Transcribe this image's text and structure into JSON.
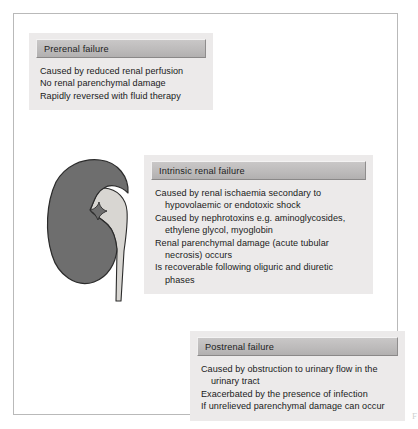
{
  "figure": {
    "edge_glyph": "F",
    "colors": {
      "panel_background": "#eceaea",
      "header_bar": "#bdbbbb",
      "text": "#1a1a1a",
      "frame_border": "#b9b9b9",
      "kidney_cortex": "#6e6e6e",
      "kidney_pelvis": "#d8d6d2",
      "kidney_outline": "#2b2b2b"
    }
  },
  "panels": [
    {
      "id": "prerenal",
      "title": "Prerenal failure",
      "lines": [
        "Caused by reduced renal perfusion",
        "No renal parenchymal damage",
        "Rapidly reversed with fluid therapy"
      ]
    },
    {
      "id": "intrinsic",
      "title": "Intrinsic renal failure",
      "lines": [
        "Caused by renal ischaemia secondary to hypovolaemic or endotoxic shock",
        "Caused by nephrotoxins e.g. aminoglycosides, ethylene glycol, myoglobin",
        "Renal parenchymal damage (acute tubular necrosis) occurs",
        "Is recoverable following oliguric and diuretic phases"
      ]
    },
    {
      "id": "postrenal",
      "title": "Postrenal failure",
      "lines": [
        "Caused by obstruction to urinary flow in the urinary tract",
        "Exacerbated by the presence of infection",
        "If unrelieved parenchymal damage can occur"
      ]
    }
  ],
  "illustration": {
    "name": "kidney-diagram",
    "label": "kidney with renal pelvis and ureter"
  }
}
